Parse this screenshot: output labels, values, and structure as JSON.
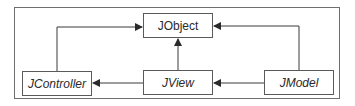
{
  "diagram": {
    "type": "class-hierarchy",
    "nodes": [
      {
        "id": "jobject",
        "label": "JObject",
        "italic": false
      },
      {
        "id": "jcontroller",
        "label": "JController",
        "italic": true
      },
      {
        "id": "jview",
        "label": "JView",
        "italic": true
      },
      {
        "id": "jmodel",
        "label": "JModel",
        "italic": true
      }
    ],
    "edges": [
      {
        "from": "jcontroller",
        "to": "jobject"
      },
      {
        "from": "jview",
        "to": "jobject"
      },
      {
        "from": "jmodel",
        "to": "jobject"
      },
      {
        "from": "jview",
        "to": "jcontroller"
      },
      {
        "from": "jmodel",
        "to": "jview"
      }
    ],
    "colors": {
      "line": "#3a3a3a",
      "box_border": "#5a5a5a",
      "frame": "#6e6e6e",
      "text": "#2a2a2a"
    }
  }
}
